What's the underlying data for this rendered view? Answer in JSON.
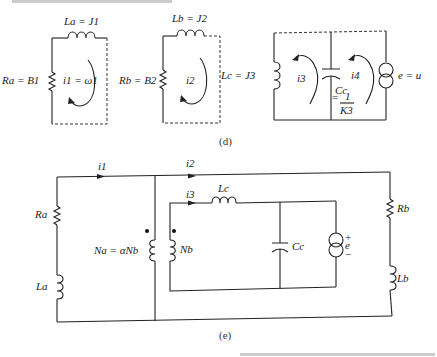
{
  "figure": {
    "panel_d": {
      "caption": "(d)",
      "circuit_a": {
        "inductor_label": "La = J1",
        "resistor_label": "Ra = B1",
        "loop_current_label": "i1 = ω1"
      },
      "circuit_b": {
        "inductor_label": "Lb = J2",
        "resistor_label": "Rb = B2",
        "loop_current_label": "i2"
      },
      "circuit_c": {
        "inductor_label": "Lc = J3",
        "capacitor_label": "Cc",
        "capacitor_value_label": "= 1 / K3",
        "capacitor_value_numerator": "1",
        "capacitor_value_denominator": "K3",
        "loop_current_label_left": "i3",
        "loop_current_label_right": "i4",
        "source_label": "e = u"
      }
    },
    "panel_e": {
      "caption": "(e)",
      "current_labels": [
        "i1",
        "i2",
        "i3"
      ],
      "resistor_a_label": "Ra",
      "inductor_a_label": "La",
      "primary_winding_label": "Na = αNb",
      "secondary_winding_label": "Nb",
      "inductor_c_label": "Lc",
      "capacitor_label": "Cc",
      "source_label": "e",
      "source_polarity": [
        "+",
        "−"
      ],
      "resistor_b_label": "Rb",
      "inductor_b_label": "Lb"
    }
  }
}
